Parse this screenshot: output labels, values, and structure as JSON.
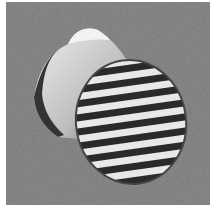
{
  "image": {
    "alt": "Grayscale photograph of two cockle seashells on textured sand",
    "subject": "two seashells",
    "colors": {
      "background": "#8a8a8a",
      "shell_light": "#e6e6e6",
      "shell_dark": "#222222",
      "frame": "#ffffff"
    }
  }
}
